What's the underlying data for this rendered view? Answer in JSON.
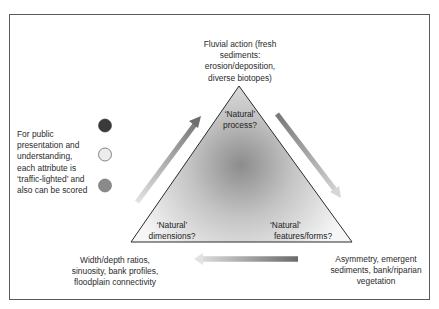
{
  "diagram": {
    "vertices": {
      "top": {
        "inner_label_line1": "‘Natural’",
        "inner_label_line2": "process?",
        "description_lines": [
          "Fluvial action (fresh",
          "sediments:",
          "erosion/deposition,",
          "diverse biotopes)"
        ]
      },
      "bottom_left": {
        "inner_label_line1": "‘Natural’",
        "inner_label_line2": "dimensions?",
        "description_lines": [
          "Width/depth ratios,",
          "sinuosity, bank profiles,",
          "floodplain connectivity"
        ]
      },
      "bottom_right": {
        "inner_label_line1": "‘Natural’",
        "inner_label_line2": "features/forms?",
        "description_lines": [
          "Asymmetry, emergent",
          "sediments, bank/riparian",
          "vegetation"
        ]
      }
    },
    "arrows": [
      {
        "id": "left-up",
        "from": "bottom_left",
        "to": "top"
      },
      {
        "id": "right-down",
        "from": "top",
        "to": "bottom_right"
      },
      {
        "id": "bottom-left",
        "from": "bottom_right",
        "to": "bottom_left"
      }
    ],
    "legend": {
      "text_lines": [
        "For public",
        "presentation and",
        "understanding,",
        "each attribute is",
        "‘traffic-lighted’ and",
        "also can be scored"
      ],
      "lights": [
        {
          "name": "dark",
          "color": "#3a3a3a"
        },
        {
          "name": "light",
          "color": "#e6e6e6"
        },
        {
          "name": "medium",
          "color": "#8a8a8a"
        }
      ]
    }
  }
}
